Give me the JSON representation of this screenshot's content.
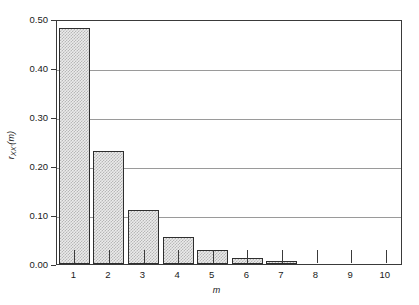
{
  "chart_data": {
    "type": "bar",
    "title": "",
    "subtitle": "",
    "xlabel": "m",
    "ylabel": "r_xx'(m)",
    "ylabel_parts": {
      "base": "r",
      "subscript": "XX'",
      "paren": "(m)"
    },
    "categories": [
      "1",
      "2",
      "3",
      "4",
      "5",
      "6",
      "7",
      "8",
      "9",
      "10"
    ],
    "values": [
      0.482,
      0.231,
      0.111,
      0.055,
      0.028,
      0.013,
      0.007,
      0.002,
      0.0,
      0.0
    ],
    "series": [
      {
        "name": "r_xx'(m)",
        "values": [
          0.482,
          0.231,
          0.111,
          0.055,
          0.028,
          0.013,
          0.007,
          0.002,
          0.0,
          0.0
        ]
      }
    ],
    "ylim": [
      0.0,
      0.5
    ],
    "xlim": [
      0.5,
      10.5
    ],
    "ytick_labels": [
      "0.00",
      "0.10",
      "0.20",
      "0.30",
      "0.40",
      "0.50"
    ],
    "ytick_values": [
      0.0,
      0.1,
      0.2,
      0.3,
      0.4,
      0.5
    ],
    "xtick_labels": [
      "1",
      "2",
      "3",
      "4",
      "5",
      "6",
      "7",
      "8",
      "9",
      "10"
    ],
    "grid": true,
    "grid_axis": "y",
    "legend": false,
    "legend_position": "none",
    "bar_fill_color": "#ebebeb",
    "bar_edge_color": "#2e2e2e",
    "grid_color": "#9a9a9a",
    "axis_color": "#3a3a3a",
    "background_color": "#ffffff",
    "annotations": []
  }
}
